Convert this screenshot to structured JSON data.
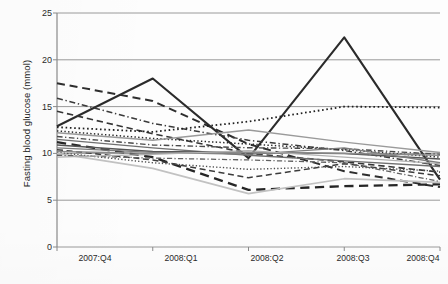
{
  "chart_data": {
    "type": "line",
    "title": "",
    "xlabel": "",
    "ylabel": "Fasting blood glucose (mmol)",
    "categories": [
      "2007:Q4",
      "2008:Q1",
      "2008:Q2",
      "2008:Q3",
      "2008:Q4"
    ],
    "ylim": [
      0,
      25
    ],
    "yticks": [
      0,
      5,
      10,
      15,
      20,
      25
    ],
    "grid": true,
    "legend": "none",
    "series": [
      {
        "name": "patient-01",
        "style": "solid",
        "color": "#2b2b2b",
        "width": 2.1,
        "values": [
          12.9,
          18.0,
          9.5,
          22.4,
          7.2
        ]
      },
      {
        "name": "patient-02",
        "style": "dashed",
        "color": "#2e2e2e",
        "width": 2.0,
        "values": [
          17.5,
          15.6,
          11.0,
          8.1,
          6.4
        ]
      },
      {
        "name": "patient-03",
        "style": "dashdot",
        "color": "#3a3a3a",
        "width": 1.5,
        "values": [
          15.9,
          13.2,
          11.4,
          10.3,
          8.7
        ]
      },
      {
        "name": "patient-04",
        "style": "dashed",
        "color": "#343434",
        "width": 1.6,
        "values": [
          14.5,
          12.1,
          10.0,
          9.1,
          8.0
        ]
      },
      {
        "name": "patient-05",
        "style": "dotted",
        "color": "#1f1f1f",
        "width": 1.8,
        "values": [
          12.8,
          12.3,
          13.4,
          15.0,
          14.9
        ]
      },
      {
        "name": "patient-06",
        "style": "dotted",
        "color": "#2a2a2a",
        "width": 1.5,
        "values": [
          12.4,
          11.6,
          11.0,
          10.4,
          9.6
        ]
      },
      {
        "name": "patient-07",
        "style": "solid",
        "color": "#9a9a9a",
        "width": 1.4,
        "values": [
          12.2,
          11.4,
          12.5,
          11.2,
          10.1
        ]
      },
      {
        "name": "patient-08",
        "style": "dashdot",
        "color": "#4a4a4a",
        "width": 1.4,
        "values": [
          11.8,
          10.9,
          10.6,
          10.5,
          9.9
        ]
      },
      {
        "name": "patient-09",
        "style": "solid",
        "color": "#6f6f6f",
        "width": 1.3,
        "values": [
          11.5,
          10.6,
          9.8,
          9.2,
          8.6
        ]
      },
      {
        "name": "patient-10",
        "style": "dashed",
        "color": "#262626",
        "width": 2.3,
        "values": [
          11.2,
          9.6,
          6.1,
          6.5,
          6.7
        ]
      },
      {
        "name": "patient-11",
        "style": "solid",
        "color": "#555555",
        "width": 1.5,
        "values": [
          10.9,
          10.2,
          10.1,
          10.0,
          9.4
        ]
      },
      {
        "name": "patient-12",
        "style": "solid",
        "color": "#7d7d7d",
        "width": 1.3,
        "values": [
          10.6,
          10.1,
          9.9,
          10.6,
          9.0
        ]
      },
      {
        "name": "patient-13",
        "style": "dashed",
        "color": "#3c3c3c",
        "width": 1.5,
        "values": [
          10.4,
          9.3,
          7.4,
          8.9,
          7.6
        ]
      },
      {
        "name": "patient-14",
        "style": "solid",
        "color": "#8a8a8a",
        "width": 1.4,
        "values": [
          10.2,
          10.0,
          10.1,
          10.0,
          9.8
        ]
      },
      {
        "name": "patient-15",
        "style": "dotted",
        "color": "#4f4f4f",
        "width": 1.4,
        "values": [
          10.1,
          9.0,
          8.3,
          8.6,
          8.1
        ]
      },
      {
        "name": "patient-16",
        "style": "solid",
        "color": "#c2c2c2",
        "width": 1.6,
        "values": [
          10.0,
          8.4,
          5.7,
          7.3,
          6.9
        ]
      },
      {
        "name": "patient-17",
        "style": "dashdot",
        "color": "#606060",
        "width": 1.3,
        "values": [
          9.8,
          9.5,
          9.3,
          9.0,
          7.0
        ]
      },
      {
        "name": "patient-18",
        "style": "solid",
        "color": "#b0b0b0",
        "width": 1.3,
        "values": [
          9.6,
          9.9,
          10.3,
          9.6,
          8.9
        ]
      }
    ]
  },
  "axes": {
    "y_label": "Fasting blood glucose (mmol)",
    "y_tick_labels": [
      "25",
      "20",
      "15",
      "10",
      "5",
      "0"
    ],
    "x_tick_labels": [
      "2007:Q4",
      "2008:Q1",
      "2008:Q2",
      "2008:Q3",
      "2008:Q4"
    ]
  }
}
